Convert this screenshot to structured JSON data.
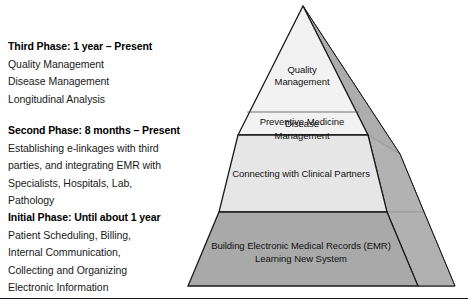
{
  "diagram": {
    "colors": {
      "tier_top_fill": "#f2f2f2",
      "tier_middle_fill": "#e6e6e6",
      "tier_base_fill": "#a9a9a9",
      "side_face_top": "#9a9a9a",
      "side_face_middle": "#bdbdbd",
      "side_face_base": "#b5b5b5",
      "outline": "#1a1a1a",
      "text": "#111111"
    }
  },
  "phases": [
    {
      "key": "third",
      "title": "Third Phase: 1 year – Present",
      "lines": [
        "Quality Management",
        "Disease Management",
        "Longitudinal Analysis"
      ]
    },
    {
      "key": "second",
      "title": "Second Phase: 8 months – Present",
      "lines": [
        "Establishing e-linkages with third",
        "parties, and integrating EMR with",
        "Specialists, Hospitals, Lab,",
        "Pathology"
      ]
    },
    {
      "key": "initial",
      "title": "Initial Phase: Until about 1 year",
      "lines": [
        "Patient Scheduling, Billing,",
        "Internal Communication,",
        "Collecting and Organizing",
        "Electronic Information"
      ]
    }
  ],
  "pyramid": {
    "tiers": [
      {
        "key": "top",
        "label_quality": "Quality\nManagement",
        "label_disease": "Disease\nManagement",
        "label_preventive": "Preventive Medicine"
      },
      {
        "key": "middle",
        "label": "Connecting with Clinical Partners"
      },
      {
        "key": "base",
        "label": "Building Electronic Medical Records (EMR)\nLearning New System"
      }
    ]
  }
}
